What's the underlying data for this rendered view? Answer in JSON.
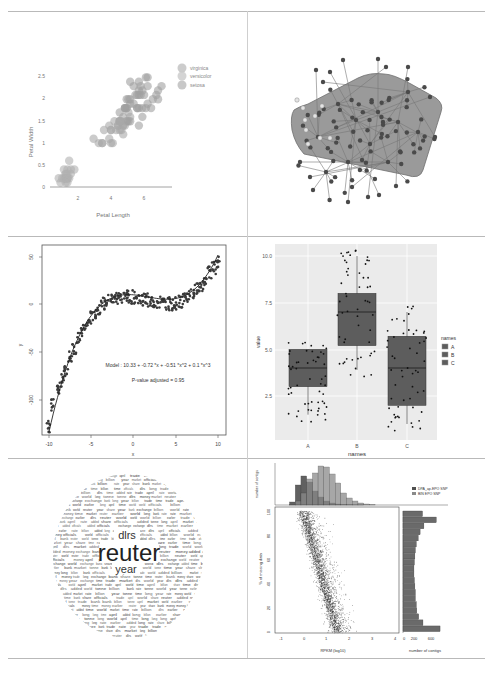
{
  "figure": {
    "panels": [
      {
        "id": "iris-scatter",
        "title": "",
        "xlabel": "Petal Length",
        "ylabel": "Petal Width",
        "xticks": [
          "2",
          "4",
          "6"
        ],
        "yticks": [
          "0",
          "0.5",
          "1",
          "1.5",
          "2",
          "2.5"
        ],
        "legend": [
          "virginica",
          "versicolor",
          "setosa"
        ]
      },
      {
        "id": "network-graph",
        "title": ""
      },
      {
        "id": "polynomial-fit",
        "xlabel": "x",
        "ylabel": "y",
        "xticks": [
          "-10",
          "-5",
          "0",
          "5",
          "10"
        ],
        "yticks": [
          "50",
          "0",
          "-50",
          "-100"
        ],
        "model_text": "Model :  10.33  +  -0.72 *x +  -0.51 *x^2 + 0.1 *x^3",
        "pvalue_text": "P-value adjusted =  0.95"
      },
      {
        "id": "boxplot",
        "xlabel": "names",
        "ylabel": "value",
        "xticks": [
          "A",
          "B",
          "C"
        ],
        "yticks": [
          "10.0",
          "7.5",
          "5.0",
          "2.5"
        ],
        "legend_title": "names",
        "legend": [
          "A",
          "B",
          "C"
        ]
      },
      {
        "id": "word-cloud",
        "words": [
          "reuter",
          "year",
          "dlrs",
          "april",
          "exchange",
          "share",
          "billion",
          "time",
          "market",
          "added",
          "world",
          "money",
          "tonne",
          "earlier",
          "long",
          "world",
          "officials",
          "rate",
          "bank",
          "trade"
        ]
      },
      {
        "id": "scatter-with-marginals",
        "xlabel": "RPKM (log10)",
        "ylabel": "% of missing data",
        "top_ylabel": "number of contigs",
        "right_xlabel": "number of contigs",
        "xticks": [
          "-1",
          "0",
          "1",
          "2",
          "3",
          "4"
        ],
        "yticks": [
          "0",
          "20",
          "40",
          "60",
          "80",
          "100"
        ],
        "top_yticks": [
          "0",
          "1000",
          "2000",
          "3000",
          "4000"
        ],
        "right_xticks": [
          "0",
          "200",
          "600"
        ],
        "legend": [
          "DPA_ap-EPO SNP",
          "BIN EPO SNP"
        ]
      }
    ]
  },
  "chart_data": [
    {
      "type": "scatter",
      "title": "",
      "xlabel": "Petal Length",
      "ylabel": "Petal Width",
      "xlim": [
        0.5,
        7.5
      ],
      "ylim": [
        0,
        2.6
      ],
      "legend_position": "right",
      "grid": false,
      "series": [
        {
          "name": "setosa",
          "x": [
            1.4,
            1.4,
            1.3,
            1.5,
            1.4,
            1.7,
            1.4,
            1.5,
            1.4,
            1.5,
            1.5,
            1.6,
            1.4,
            1.1,
            1.2,
            1.5,
            1.3,
            1.4,
            1.7,
            1.5,
            1.0,
            1.9,
            1.6
          ],
          "y": [
            0.2,
            0.2,
            0.2,
            0.2,
            0.2,
            0.4,
            0.3,
            0.2,
            0.2,
            0.1,
            0.2,
            0.2,
            0.1,
            0.1,
            0.2,
            0.4,
            0.4,
            0.3,
            0.3,
            0.3,
            0.2,
            0.4,
            0.6
          ]
        },
        {
          "name": "versicolor",
          "x": [
            4.7,
            4.5,
            4.9,
            4.0,
            4.6,
            4.5,
            4.7,
            3.3,
            4.6,
            3.9,
            3.5,
            4.2,
            4.0,
            4.7,
            3.6,
            4.4,
            4.5,
            4.1,
            4.5,
            3.9,
            4.8,
            4.0,
            4.9,
            4.7,
            4.3,
            4.4,
            4.8,
            5.0,
            4.5,
            3.5,
            3.0,
            5.1
          ],
          "y": [
            1.4,
            1.5,
            1.5,
            1.3,
            1.5,
            1.3,
            1.6,
            1.0,
            1.3,
            1.4,
            1.0,
            1.5,
            1.0,
            1.4,
            1.3,
            1.4,
            1.5,
            1.0,
            1.5,
            1.1,
            1.8,
            1.3,
            1.5,
            1.2,
            1.3,
            1.4,
            1.4,
            1.7,
            1.5,
            1.0,
            1.1,
            1.6
          ]
        },
        {
          "name": "virginica",
          "x": [
            6.0,
            5.1,
            5.9,
            5.6,
            5.8,
            6.6,
            4.5,
            6.3,
            5.8,
            6.1,
            5.1,
            5.3,
            5.5,
            5.0,
            5.1,
            5.3,
            5.5,
            6.7,
            6.9,
            5.0,
            5.7,
            4.9,
            6.7,
            4.9,
            5.7,
            6.0,
            4.8,
            4.9,
            5.6,
            5.8,
            6.1,
            6.4,
            5.6,
            5.1,
            5.6,
            6.1,
            5.6,
            5.5,
            4.8,
            5.4
          ],
          "y": [
            2.5,
            1.9,
            2.1,
            1.8,
            2.2,
            2.1,
            1.7,
            1.8,
            1.8,
            2.5,
            2.0,
            1.9,
            2.1,
            2.0,
            2.4,
            2.3,
            1.8,
            2.2,
            2.3,
            1.5,
            2.3,
            2.0,
            2.0,
            1.8,
            2.1,
            1.8,
            1.8,
            1.8,
            2.1,
            1.6,
            1.9,
            2.0,
            2.2,
            1.5,
            1.4,
            2.3,
            2.4,
            1.8,
            1.8,
            2.1
          ]
        }
      ]
    },
    {
      "type": "network",
      "title": "",
      "description": "Tree-like network graph with ~100 dark nodes and a small cluster of light nodes on the left, with a shaded convex hull covering the central community"
    },
    {
      "type": "scatter",
      "title": "",
      "xlabel": "x",
      "ylabel": "y",
      "xlim": [
        -10,
        10
      ],
      "ylim": [
        -135,
        55
      ],
      "grid": false,
      "annotations": [
        "Model :  10.33  +  -0.72 *x +  -0.51 *x^2 + 0.1 *x^3",
        "P-value adjusted =  0.95"
      ],
      "fit": {
        "type": "cubic",
        "coefficients": [
          10.33,
          -0.72,
          -0.51,
          0.1
        ]
      },
      "series": [
        {
          "name": "points",
          "x": [
            -10,
            -9.5,
            -9,
            -8.5,
            -8,
            -7.5,
            -7,
            -6.5,
            -6,
            -5.5,
            -5,
            -4.5,
            -4,
            -3.5,
            -3,
            -2.5,
            -2,
            -1.5,
            -1,
            -0.5,
            0,
            0.5,
            1,
            1.5,
            2,
            2.5,
            3,
            3.5,
            4,
            4.5,
            5,
            5.5,
            6,
            6.5,
            7,
            7.5,
            8,
            8.5,
            9,
            9.5,
            10
          ],
          "y": [
            -128,
            -105,
            -92,
            -80,
            -68,
            -55,
            -45,
            -36,
            -28,
            -20,
            -14,
            -8,
            -3,
            1,
            4,
            6,
            7,
            8,
            8,
            8,
            8,
            7,
            6,
            5,
            4,
            3,
            2,
            1,
            1,
            1,
            2,
            3,
            5,
            8,
            12,
            16,
            21,
            27,
            33,
            39,
            44
          ]
        },
        {
          "name": "fit",
          "type": "line",
          "x": [
            -10,
            -8,
            -6,
            -4,
            -2,
            0,
            2,
            4,
            6,
            8,
            10
          ],
          "y": [
            -134.5,
            -69.8,
            -27.5,
            -3.7,
            6.0,
            10.3,
            8.3,
            6.5,
            11.8,
            30.9,
            60.1
          ]
        }
      ]
    },
    {
      "type": "box",
      "title": "",
      "xlabel": "names",
      "ylabel": "value",
      "categories": [
        "A",
        "B",
        "C"
      ],
      "ylim": [
        0.3,
        10.8
      ],
      "grid": true,
      "legend_position": "right",
      "legend_title": "names",
      "series": [
        {
          "name": "A",
          "min": 1.5,
          "q1": 3.0,
          "median": 4.0,
          "q3": 5.0,
          "max": 5.0
        },
        {
          "name": "B",
          "min": 3.9,
          "q1": 5.2,
          "median": 7.0,
          "q3": 8.0,
          "max": 10.0
        },
        {
          "name": "C",
          "min": 1.0,
          "q1": 2.0,
          "median": 4.0,
          "q3": 5.7,
          "max": 7.0
        }
      ]
    },
    {
      "type": "wordcloud",
      "title": "",
      "words": [
        {
          "text": "reuter",
          "weight": 100
        },
        {
          "text": "year",
          "weight": 35
        },
        {
          "text": "dlrs",
          "weight": 30
        },
        {
          "text": "april",
          "weight": 20
        },
        {
          "text": "exchange",
          "weight": 14
        },
        {
          "text": "share",
          "weight": 12
        },
        {
          "text": "billion",
          "weight": 12
        },
        {
          "text": "time",
          "weight": 12
        },
        {
          "text": "market",
          "weight": 11
        },
        {
          "text": "added",
          "weight": 11
        },
        {
          "text": "money",
          "weight": 10
        },
        {
          "text": "earlier",
          "weight": 10
        },
        {
          "text": "tonne",
          "weight": 9
        },
        {
          "text": "world",
          "weight": 9
        },
        {
          "text": "long",
          "weight": 8
        }
      ]
    },
    {
      "type": "scatter",
      "title": "",
      "xlabel": "RPKM (log10)",
      "ylabel": "% of missing data",
      "xlim": [
        -1.2,
        4.1
      ],
      "ylim": [
        -2,
        100
      ],
      "legend": [
        "DPA_ap-EPO SNP",
        "BIN EPO SNP"
      ],
      "legend_position": "top-right",
      "marginal_top": {
        "type": "bar",
        "ylabel": "number of contigs",
        "ylim": [
          0,
          4000
        ],
        "categories": [
          -0.5,
          -0.25,
          0,
          0.25,
          0.5,
          0.75,
          1.0,
          1.25,
          1.5,
          1.75,
          2.0,
          2.25,
          2.5,
          2.75,
          3.0
        ],
        "series": [
          {
            "name": "DPA_ap-EPO SNP",
            "values": [
              300,
              2000,
              2900,
              2300,
              1400,
              800,
              400,
              200,
              100,
              50,
              20,
              10,
              5,
              0,
              0
            ]
          },
          {
            "name": "BIN EPO SNP",
            "values": [
              50,
              400,
              1200,
              2600,
              3200,
              3900,
              3800,
              3100,
              2200,
              1200,
              700,
              400,
              200,
              100,
              50
            ]
          }
        ]
      },
      "marginal_right": {
        "type": "barh",
        "xlabel": "number of contigs",
        "xlim": [
          0,
          800
        ],
        "categories": [
          0,
          5,
          10,
          15,
          20,
          25,
          30,
          35,
          40,
          45,
          50,
          55,
          60,
          65,
          70,
          75,
          80,
          85,
          90,
          95
        ],
        "values": [
          780,
          420,
          330,
          290,
          280,
          260,
          260,
          250,
          240,
          230,
          230,
          240,
          250,
          260,
          280,
          320,
          360,
          440,
          700,
          410
        ]
      },
      "description": "Dense scatter of contigs; % missing data decreases as RPKM increases, from ~100% at RPKM≈0 to ~0% at RPKM≈1.5"
    }
  ]
}
